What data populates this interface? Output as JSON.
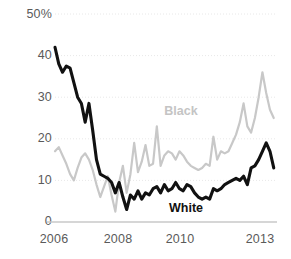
{
  "chart_data": {
    "type": "line",
    "title": "",
    "subtitle": "",
    "xlabel": "",
    "ylabel": "",
    "ylim": [
      0,
      50
    ],
    "xlim": [
      2006.0,
      2013.0
    ],
    "grid": true,
    "legend_position": "inline-annotation",
    "y_ticks": [
      {
        "value": 0,
        "label": "0"
      },
      {
        "value": 10,
        "label": "10"
      },
      {
        "value": 20,
        "label": "20"
      },
      {
        "value": 30,
        "label": "30"
      },
      {
        "value": 40,
        "label": "40"
      },
      {
        "value": 50,
        "label": "50%"
      }
    ],
    "x_ticks": [
      {
        "value": 2006,
        "label": "2006"
      },
      {
        "value": 2008,
        "label": "2008"
      },
      {
        "value": 2010,
        "label": "2010"
      },
      {
        "value": 2013,
        "label": "2013"
      }
    ],
    "annotations": [
      {
        "text": "Black",
        "x": 2010.05,
        "y": 26.5,
        "color": "#c4c4c4"
      },
      {
        "text": "White",
        "x": 2010.2,
        "y": 3.2,
        "color": "#111111"
      }
    ],
    "colors": {
      "black_series": "#c8c8c8",
      "white_series": "#111111",
      "axis": "#c9c9c9",
      "grid": "#e8e8e8",
      "tick_text": "#5a5a5a"
    },
    "series": [
      {
        "name": "Black",
        "color": "#c8c8c8",
        "x": [
          2006.0,
          2006.12,
          2006.24,
          2006.36,
          2006.48,
          2006.6,
          2006.72,
          2006.84,
          2006.96,
          2007.08,
          2007.2,
          2007.32,
          2007.44,
          2007.56,
          2007.68,
          2007.8,
          2007.92,
          2008.04,
          2008.16,
          2008.28,
          2008.4,
          2008.52,
          2008.64,
          2008.76,
          2008.88,
          2009.0,
          2009.12,
          2009.24,
          2009.36,
          2009.48,
          2009.6,
          2009.72,
          2009.84,
          2009.96,
          2010.08,
          2010.2,
          2010.32,
          2010.44,
          2010.56,
          2010.68,
          2010.8,
          2010.92,
          2011.04,
          2011.16,
          2011.28,
          2011.4,
          2011.52,
          2011.64,
          2011.76,
          2011.88,
          2012.0,
          2012.12,
          2012.24,
          2012.36,
          2012.48,
          2012.6,
          2012.72,
          2012.84,
          2012.96
        ],
        "values": [
          17.0,
          18.0,
          16.0,
          14.0,
          11.5,
          10.0,
          13.0,
          15.5,
          16.5,
          15.0,
          12.5,
          9.0,
          6.0,
          8.5,
          11.0,
          6.5,
          2.5,
          9.5,
          13.5,
          7.0,
          11.5,
          19.0,
          12.0,
          14.5,
          18.5,
          13.5,
          14.0,
          23.0,
          13.5,
          16.0,
          17.0,
          16.5,
          15.0,
          17.0,
          16.0,
          14.5,
          13.5,
          13.0,
          12.5,
          13.0,
          14.0,
          13.5,
          20.5,
          15.0,
          17.0,
          16.5,
          17.0,
          19.0,
          21.0,
          24.0,
          28.5,
          23.0,
          21.5,
          25.0,
          30.0,
          36.0,
          31.0,
          27.0,
          25.0
        ]
      },
      {
        "name": "White",
        "color": "#111111",
        "x": [
          2006.0,
          2006.12,
          2006.24,
          2006.36,
          2006.48,
          2006.6,
          2006.72,
          2006.84,
          2006.96,
          2007.08,
          2007.2,
          2007.32,
          2007.44,
          2007.56,
          2007.68,
          2007.8,
          2007.92,
          2008.04,
          2008.16,
          2008.28,
          2008.4,
          2008.52,
          2008.64,
          2008.76,
          2008.88,
          2009.0,
          2009.12,
          2009.24,
          2009.36,
          2009.48,
          2009.6,
          2009.72,
          2009.84,
          2009.96,
          2010.08,
          2010.2,
          2010.32,
          2010.44,
          2010.56,
          2010.68,
          2010.8,
          2010.92,
          2011.04,
          2011.16,
          2011.28,
          2011.4,
          2011.52,
          2011.64,
          2011.76,
          2011.88,
          2012.0,
          2012.12,
          2012.24,
          2012.36,
          2012.48,
          2012.6,
          2012.72,
          2012.84,
          2012.96
        ],
        "values": [
          42.0,
          38.0,
          36.0,
          37.5,
          37.0,
          33.5,
          30.0,
          28.5,
          24.0,
          28.5,
          22.0,
          15.0,
          11.5,
          11.0,
          10.5,
          9.5,
          7.0,
          9.5,
          6.0,
          3.0,
          6.5,
          5.5,
          7.5,
          5.5,
          7.0,
          6.5,
          8.0,
          8.5,
          7.0,
          9.0,
          7.5,
          8.0,
          9.5,
          8.0,
          7.5,
          9.0,
          8.5,
          7.0,
          6.0,
          5.5,
          6.0,
          5.5,
          8.0,
          7.5,
          8.0,
          9.0,
          9.5,
          10.0,
          10.5,
          10.0,
          11.0,
          9.0,
          13.0,
          13.5,
          15.0,
          17.0,
          19.0,
          17.0,
          13.0
        ]
      }
    ]
  }
}
